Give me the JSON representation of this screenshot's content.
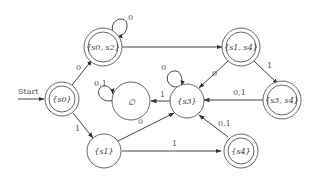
{
  "diagram": {
    "type": "deterministic finite-state automaton",
    "start_label": "Start",
    "states": [
      {
        "id": "s0",
        "label": "{s0}",
        "final": true,
        "start": true
      },
      {
        "id": "s0s2",
        "label": "{s0, s2}",
        "final": true,
        "start": false
      },
      {
        "id": "s1s4",
        "label": "{s1, s4}",
        "final": true,
        "start": false
      },
      {
        "id": "s3s4",
        "label": "{s3, s4}",
        "final": true,
        "start": false
      },
      {
        "id": "empty",
        "label": "∅",
        "final": false,
        "start": false
      },
      {
        "id": "s3",
        "label": "{s3}",
        "final": false,
        "start": false
      },
      {
        "id": "s1",
        "label": "{s1}",
        "final": false,
        "start": false
      },
      {
        "id": "s4",
        "label": "{s4}",
        "final": true,
        "start": false
      }
    ],
    "transitions": [
      {
        "from": "s0",
        "to": "s0s2",
        "label": "0"
      },
      {
        "from": "s0",
        "to": "s1",
        "label": "1"
      },
      {
        "from": "s0s2",
        "to": "s0s2",
        "label": "0"
      },
      {
        "from": "s0s2",
        "to": "s1s4",
        "label": ""
      },
      {
        "from": "s1s4",
        "to": "s3",
        "label": "0"
      },
      {
        "from": "s1s4",
        "to": "s3s4",
        "label": "1"
      },
      {
        "from": "s3s4",
        "to": "s3",
        "label": "0,1"
      },
      {
        "from": "s3",
        "to": "s3",
        "label": "0"
      },
      {
        "from": "s3",
        "to": "empty",
        "label": "1"
      },
      {
        "from": "empty",
        "to": "empty",
        "label": "0,1"
      },
      {
        "from": "s1",
        "to": "s3",
        "label": "0"
      },
      {
        "from": "s1",
        "to": "s4",
        "label": "1"
      },
      {
        "from": "s4",
        "to": "s3",
        "label": "0,1"
      }
    ]
  }
}
